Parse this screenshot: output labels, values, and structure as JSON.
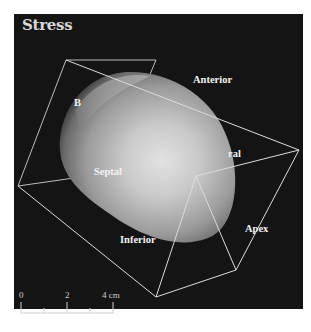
{
  "figure": {
    "title": "Stress",
    "background_color": "#141414",
    "edge_color": "#d9d9d9",
    "labels": {
      "base": "B",
      "anterior": "Anterior",
      "lateral_partial": "ral",
      "septal": "Septal",
      "inferior": "Inferior",
      "apex": "Apex"
    },
    "scale_bar": {
      "tick_labels": [
        "0",
        "2",
        "4 cm"
      ],
      "unit": "cm",
      "max_value": 4,
      "minor_ticks": 5
    }
  }
}
